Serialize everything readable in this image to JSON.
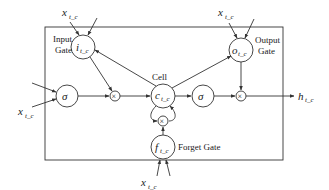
{
  "diagram": {
    "labels": {
      "input_gate_line1": "Input",
      "input_gate_line2": "Gate",
      "output_gate_line1": "Output",
      "output_gate_line2": "Gate",
      "cell": "Cell",
      "forget_gate": "Forget Gate"
    },
    "nodes": {
      "input_gate": "i",
      "input_gate_sub": "t_c",
      "output_gate": "o",
      "output_gate_sub": "t_c",
      "cell_state": "c",
      "cell_state_sub": "t_c",
      "forget_gate": "f",
      "forget_gate_sub": "t_c",
      "sigma_in": "σ",
      "sigma_out": "σ",
      "mult": "×"
    },
    "inputs": {
      "x_top_left": "x",
      "x_top_right": "x",
      "x_left": "x",
      "x_bottom": "x",
      "sub": "t_c"
    },
    "output": {
      "h": "h",
      "h_sub": "t_c"
    }
  }
}
